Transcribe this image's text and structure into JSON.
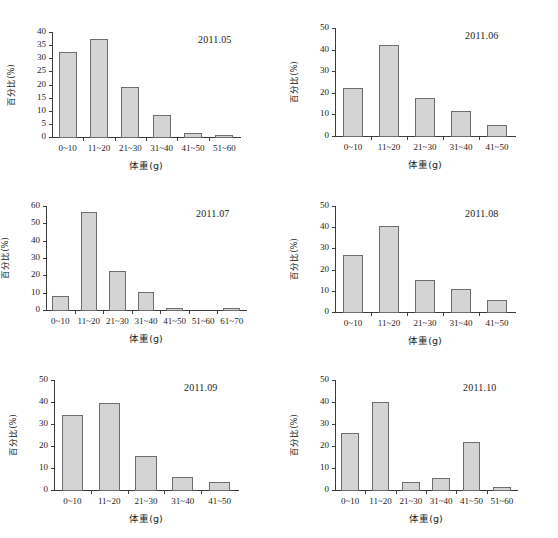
{
  "figure": {
    "panel_count": 6,
    "shared_xlabel": "体重(g)",
    "shared_ylabel": "百分比(%)",
    "bar_fill": "#d4d4d4",
    "bar_stroke": "#6e6e6e",
    "axis_color": "#3b3b3b",
    "background": "#ffffff"
  },
  "chart_data": [
    {
      "type": "bar",
      "title": "2011.05",
      "xlabel": "体重(g)",
      "ylabel": "百分比(%)",
      "categories": [
        "0~10",
        "11~20",
        "21~30",
        "31~40",
        "41~50",
        "51~60"
      ],
      "values": [
        32.3,
        37.3,
        19.1,
        8.2,
        1.5,
        0.8
      ],
      "ylim": [
        0,
        40
      ],
      "yticks": [
        0,
        5,
        10,
        15,
        20,
        25,
        30,
        35,
        40
      ],
      "grid": false,
      "legend": "none"
    },
    {
      "type": "bar",
      "title": "2011.06",
      "xlabel": "体重(g)",
      "ylabel": "百分比(%)",
      "categories": [
        "0~10",
        "11~20",
        "21~30",
        "31~40",
        "41~50"
      ],
      "values": [
        22.3,
        42.2,
        17.4,
        11.7,
        5.3
      ],
      "ylim": [
        0,
        50
      ],
      "yticks": [
        0,
        10,
        20,
        30,
        40,
        50
      ],
      "grid": false,
      "legend": "none"
    },
    {
      "type": "bar",
      "title": "2011.07",
      "xlabel": "体重(g)",
      "ylabel": "百分比(%)",
      "categories": [
        "0~10",
        "11~20",
        "21~30",
        "31~40",
        "41~50",
        "51~60",
        "61~70"
      ],
      "values": [
        7.9,
        56.6,
        22.3,
        10.1,
        1.4,
        0.0,
        1.2
      ],
      "ylim": [
        0,
        60
      ],
      "yticks": [
        0,
        10,
        20,
        30,
        40,
        50,
        60
      ],
      "grid": false,
      "legend": "none"
    },
    {
      "type": "bar",
      "title": "2011.08",
      "xlabel": "体重(g)",
      "ylabel": "百分比(%)",
      "categories": [
        "0~10",
        "11~20",
        "21~30",
        "31~40",
        "41~50"
      ],
      "values": [
        27.1,
        40.5,
        15.1,
        10.8,
        5.5
      ],
      "ylim": [
        0,
        50
      ],
      "yticks": [
        0,
        10,
        20,
        30,
        40,
        50
      ],
      "grid": false,
      "legend": "none"
    },
    {
      "type": "bar",
      "title": "2011.09",
      "xlabel": "体重(g)",
      "ylabel": "百分比(%)",
      "categories": [
        "0~10",
        "11~20",
        "21~30",
        "31~40",
        "41~50"
      ],
      "values": [
        34.2,
        39.5,
        15.6,
        6.0,
        3.7
      ],
      "ylim": [
        0,
        50
      ],
      "yticks": [
        0,
        10,
        20,
        30,
        40,
        50
      ],
      "grid": false,
      "legend": "none"
    },
    {
      "type": "bar",
      "title": "2011.10",
      "xlabel": "体重(g)",
      "ylabel": "百分比(%)",
      "categories": [
        "0~10",
        "11~20",
        "21~30",
        "31~40",
        "41~50",
        "51~60"
      ],
      "values": [
        25.8,
        39.9,
        3.6,
        5.5,
        21.7,
        1.4
      ],
      "ylim": [
        0,
        50
      ],
      "yticks": [
        0,
        10,
        20,
        30,
        40,
        50
      ],
      "grid": false,
      "legend": "none"
    }
  ]
}
